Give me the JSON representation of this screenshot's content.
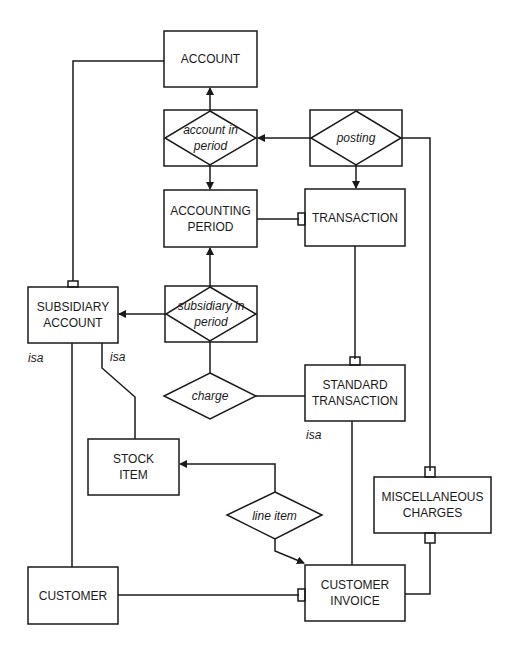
{
  "diagram": {
    "type": "entity-relationship",
    "entities": {
      "account": "ACCOUNT",
      "accounting_period_1": "ACCOUNTING",
      "accounting_period_2": "PERIOD",
      "transaction": "TRANSACTION",
      "subsidiary_account_1": "SUBSIDIARY",
      "subsidiary_account_2": "ACCOUNT",
      "standard_transaction_1": "STANDARD",
      "standard_transaction_2": "TRANSACTION",
      "stock_item_1": "STOCK",
      "stock_item_2": "ITEM",
      "misc_charges_1": "MISCELLANEOUS",
      "misc_charges_2": "CHARGES",
      "customer": "CUSTOMER",
      "customer_invoice_1": "CUSTOMER",
      "customer_invoice_2": "INVOICE"
    },
    "relationships": {
      "account_in_period_1": "account in",
      "account_in_period_2": "period",
      "posting": "posting",
      "subsidiary_in_period_1": "subsidiary in",
      "subsidiary_in_period_2": "period",
      "charge": "charge",
      "line_item": "line item"
    },
    "labels": {
      "isa_customer": "isa",
      "isa_stock": "isa",
      "isa_standard": "isa"
    },
    "colors": {
      "stroke": "#1a1a1a",
      "background": "#ffffff"
    }
  }
}
